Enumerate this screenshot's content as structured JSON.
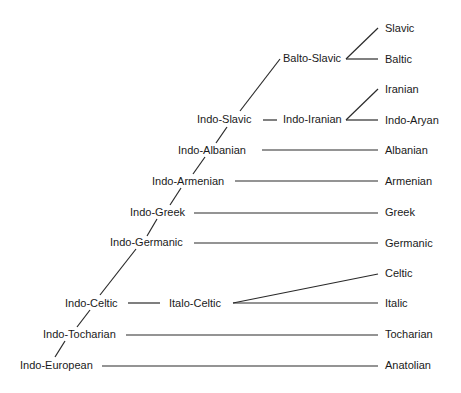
{
  "nodes": {
    "indo_european": "Indo-European",
    "indo_tocharian": "Indo-Tocharian",
    "indo_celtic": "Indo-Celtic",
    "italo_celtic": "Italo-Celtic",
    "indo_germanic": "Indo-Germanic",
    "indo_greek": "Indo-Greek",
    "indo_armenian": "Indo-Armenian",
    "indo_albanian": "Indo-Albanian",
    "indo_slavic": "Indo-Slavic",
    "indo_iranian": "Indo-Iranian",
    "balto_slavic": "Balto-Slavic"
  },
  "leaves": {
    "slavic": "Slavic",
    "baltic": "Baltic",
    "iranian": "Iranian",
    "indo_aryan": "Indo-Aryan",
    "albanian": "Albanian",
    "armenian": "Armenian",
    "greek": "Greek",
    "germanic": "Germanic",
    "celtic": "Celtic",
    "italic": "Italic",
    "tocharian": "Tocharian",
    "anatolian": "Anatolian"
  },
  "colors": {
    "line": "#2a2a2a",
    "text": "#1a1a1a"
  }
}
